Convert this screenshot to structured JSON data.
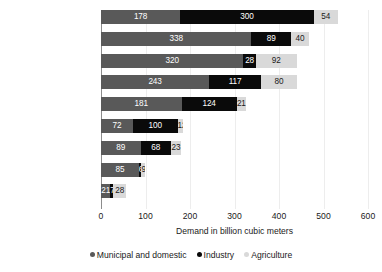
{
  "chart_data": {
    "type": "bar",
    "orientation": "horizontal",
    "stacked": true,
    "title": "",
    "xlabel": "Demand in billion cubic meters",
    "ylabel": "",
    "xlim": [
      0,
      600
    ],
    "xticks": [
      0,
      100,
      200,
      300,
      400,
      500,
      600
    ],
    "grid": true,
    "legend_position": "bottom",
    "categories": [
      "China",
      "India",
      "Sub-Saharan Africa",
      "Rest of Asia",
      "North America",
      "Europe",
      "South America",
      "Middle East and\nNorth Africa",
      "Oceania"
    ],
    "series": [
      {
        "name": "Municipal and domestic",
        "color": "#595959",
        "values": [
          178,
          338,
          320,
          243,
          181,
          72,
          89,
          85,
          21
        ]
      },
      {
        "name": "Industry",
        "color": "#0a0a0a",
        "values": [
          300,
          89,
          28,
          117,
          124,
          100,
          68,
          6,
          7
        ]
      },
      {
        "name": "Agriculture",
        "color": "#d9d9d9",
        "values": [
          54,
          40,
          92,
          80,
          21,
          12,
          23,
          9,
          28
        ]
      }
    ]
  },
  "axis": {
    "tick_labels": [
      "0",
      "100",
      "200",
      "300",
      "400",
      "500",
      "600"
    ],
    "title": "Demand in billion cubic meters"
  },
  "legend": {
    "items": [
      {
        "label": "Municipal and domestic",
        "color": "#595959"
      },
      {
        "label": "Industry",
        "color": "#0a0a0a"
      },
      {
        "label": "Agriculture",
        "color": "#d9d9d9"
      }
    ]
  }
}
